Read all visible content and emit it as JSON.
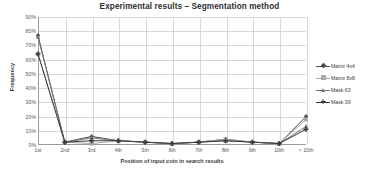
{
  "chart_data": {
    "type": "line",
    "title": "Experimental results – Segmentation method",
    "xlabel": "Position of input coin in search results",
    "ylabel": "Frequency",
    "categories": [
      "1st",
      "2nd",
      "3rd",
      "4th",
      "5th",
      "6th",
      "7th",
      "8th",
      "9th",
      "10th",
      "> 10th"
    ],
    "ylim": [
      0,
      90
    ],
    "ytick_labels": [
      "0%",
      "10%",
      "20%",
      "30%",
      "40%",
      "50%",
      "60%",
      "70%",
      "80%",
      "90%"
    ],
    "ytick_values": [
      0,
      10,
      20,
      30,
      40,
      50,
      60,
      70,
      80,
      90
    ],
    "grid": true,
    "legend_position": "right",
    "series": [
      {
        "name": "Matrix 4x4",
        "color": "#4a4a4a",
        "marker": "diamond",
        "values": [
          77,
          2,
          6,
          3,
          2,
          1,
          2,
          4,
          2,
          1,
          20
        ]
      },
      {
        "name": "Matrix 8x8",
        "color": "#a8a8a8",
        "marker": "square",
        "values": [
          64,
          2,
          1,
          3,
          2,
          1,
          2,
          4,
          2,
          1,
          18
        ]
      },
      {
        "name": "Mask 63",
        "color": "#767676",
        "marker": "triangle",
        "values": [
          76,
          2,
          5,
          3,
          2,
          1,
          2,
          3,
          2,
          1,
          13
        ]
      },
      {
        "name": "Mask 39",
        "color": "#3a3a3a",
        "marker": "cross",
        "values": [
          64,
          2,
          3,
          3,
          2,
          1,
          2,
          3,
          2,
          1,
          11
        ]
      }
    ]
  }
}
